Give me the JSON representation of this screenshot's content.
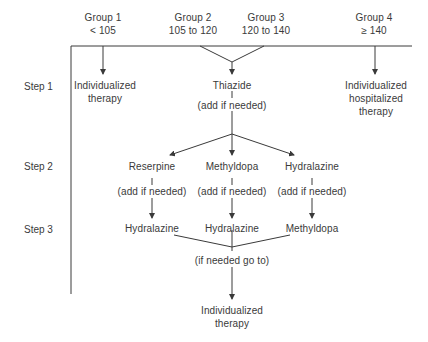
{
  "groups": [
    {
      "name": "Group 1",
      "range": "< 105"
    },
    {
      "name": "Group 2",
      "range": "105 to 120"
    },
    {
      "name": "Group 3",
      "range": "120 to 140"
    },
    {
      "name": "Group 4",
      "range": "≥ 140"
    }
  ],
  "steps": [
    "Step 1",
    "Step 2",
    "Step 3"
  ],
  "step1": {
    "group1": [
      "Individualized",
      "therapy"
    ],
    "center": "Thiazide",
    "center_note": "(add if needed)",
    "group4": [
      "Individualized",
      "hospitalized",
      "therapy"
    ]
  },
  "step2": [
    {
      "drug": "Reserpine",
      "note": "(add if needed)"
    },
    {
      "drug": "Methyldopa",
      "note": "(add if needed)"
    },
    {
      "drug": "Hydralazine",
      "note": "(add if needed)"
    }
  ],
  "step3": [
    "Hydralazine",
    "Hydralazine",
    "Methyldopa"
  ],
  "merge_note": "(if needed go to)",
  "final": [
    "Individualized",
    "therapy"
  ],
  "colors": {
    "line": "#3a3a3a",
    "text": "#3a3a3a",
    "background": "#ffffff"
  }
}
